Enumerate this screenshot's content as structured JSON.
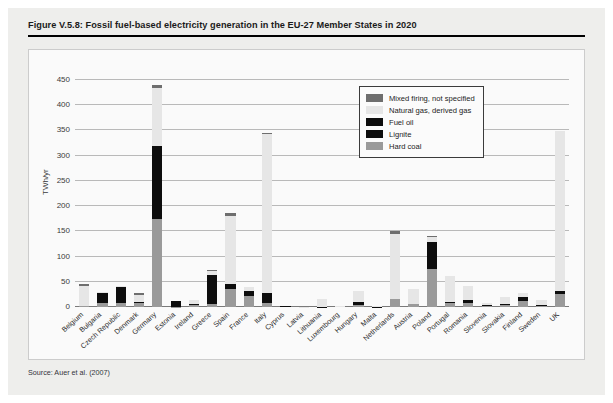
{
  "figure": {
    "title": "Figure V.5.8: Fossil fuel-based electricity generation in the EU-27 Member States in 2020",
    "source": "Source: Auer et al. (2007)"
  },
  "colors": {
    "hard_coal": "#9a9a9a",
    "lignite": "#0d0d0d",
    "fuel_oil": "#0d0d0d",
    "natural_gas": "#e6e6e6",
    "mixed_firing": "#6e6e6e",
    "panel_background": "#fafafa",
    "figure_background": "#eeeeec",
    "gridline": "#b9b9b9"
  },
  "legend": {
    "position": "top-right-inside",
    "entries": [
      {
        "key": "mixed_firing",
        "label": "Mixed firing, not specified",
        "color": "#6e6e6e"
      },
      {
        "key": "natural_gas",
        "label": "Natural gas, derived gas",
        "color": "#e6e6e6"
      },
      {
        "key": "fuel_oil",
        "label": "Fuel oil",
        "color": "#0d0d0d"
      },
      {
        "key": "lignite",
        "label": "Lignite",
        "color": "#0d0d0d"
      },
      {
        "key": "hard_coal",
        "label": "Hard coal",
        "color": "#9a9a9a"
      }
    ]
  },
  "chart_data": {
    "type": "bar",
    "stacked": true,
    "title": "Fossil fuel-based electricity generation in the EU-27 Member States in 2020",
    "xlabel": "",
    "ylabel": "TWh/yr",
    "ylim": [
      0,
      450
    ],
    "ytick_labels": [
      "0",
      "50",
      "100",
      "150",
      "200",
      "250",
      "300",
      "350",
      "400",
      "450"
    ],
    "yticks": [
      0,
      50,
      100,
      150,
      200,
      250,
      300,
      350,
      400,
      450
    ],
    "grid": true,
    "legend_position": "upper right",
    "categories": [
      "Belgium",
      "Bulgaria",
      "Czech Republic",
      "Denmark",
      "Germany",
      "Estonia",
      "Ireland",
      "Greece",
      "Spain",
      "France",
      "Italy",
      "Cyprus",
      "Latvia",
      "Lithuania",
      "Luxembourg",
      "Hungary",
      "Malta",
      "Netherlands",
      "Austria",
      "Poland",
      "Portugal",
      "Romania",
      "Slovenia",
      "Slovakia",
      "Finland",
      "Sweden",
      "UK"
    ],
    "series": [
      {
        "name": "Hard coal",
        "key": "hard_coal",
        "values": [
          2,
          7,
          7,
          7,
          175,
          1,
          4,
          6,
          36,
          22,
          8,
          0,
          0,
          0,
          0,
          4,
          0,
          16,
          5,
          76,
          7,
          7,
          2,
          4,
          11,
          3,
          26
        ]
      },
      {
        "name": "Lignite",
        "key": "lignite",
        "values": [
          0,
          20,
          32,
          0,
          145,
          10,
          0,
          57,
          0,
          0,
          0,
          0,
          0,
          0,
          0,
          5,
          0,
          0,
          0,
          52,
          0,
          3,
          3,
          0,
          5,
          0,
          0
        ]
      },
      {
        "name": "Fuel oil",
        "key": "fuel_oil",
        "values": [
          0,
          0,
          0,
          3,
          0,
          0,
          2,
          0,
          10,
          10,
          19,
          2,
          0,
          1,
          0,
          0,
          1,
          0,
          0,
          0,
          3,
          3,
          0,
          1,
          3,
          2,
          5
        ]
      },
      {
        "name": "Natural gas, derived gas",
        "key": "natural_gas",
        "values": [
          39,
          2,
          2,
          14,
          115,
          0,
          8,
          8,
          135,
          7,
          316,
          0,
          1,
          14,
          3,
          22,
          2,
          129,
          31,
          10,
          52,
          28,
          3,
          14,
          8,
          9,
          317
        ]
      },
      {
        "name": "Mixed firing, not specified",
        "key": "mixed_firing",
        "values": [
          4,
          0,
          0,
          3,
          5,
          0,
          0,
          2,
          5,
          0,
          2,
          0,
          0,
          0,
          0,
          0,
          0,
          5,
          0,
          2,
          0,
          0,
          0,
          0,
          0,
          0,
          0
        ]
      }
    ]
  }
}
